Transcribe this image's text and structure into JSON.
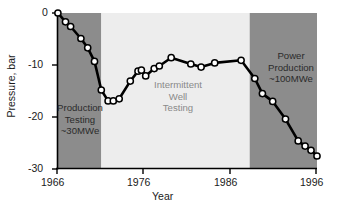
{
  "chart_data": {
    "type": "line",
    "title": "",
    "xlabel": "Year",
    "ylabel": "Pressure, bar",
    "xlim": [
      1966,
      1996
    ],
    "ylim": [
      -30,
      0
    ],
    "xticks": [
      1966,
      1976,
      1986,
      1996
    ],
    "yticks": [
      0,
      -10,
      -20,
      -30
    ],
    "xtick_labels": [
      "1966",
      "1976",
      "1986",
      "1996"
    ],
    "ytick_labels": [
      "0",
      "-10",
      "-20",
      "-30"
    ],
    "grid": false,
    "legend": "none",
    "series": [
      {
        "name": "Reservoir pressure",
        "marker": "circle-open-white",
        "line_color": "#000000",
        "marker_face": "#ffffff",
        "x": [
          1966.1,
          1967.0,
          1967.6,
          1968.8,
          1969.6,
          1970.4,
          1971.1,
          1971.8,
          1972.4,
          1973.0,
          1974.4,
          1975.3,
          1975.8,
          1976.3,
          1977.3,
          1978.6,
          1979.3,
          1981.6,
          1984.6,
          1985.8,
          1987.4,
          1990.4,
          1991.4,
          1992.3,
          1993.3,
          1996.0,
          1996.0,
          1997.0
        ],
        "y": [
          -0.1,
          -1.7,
          -2.6,
          -4.9,
          -6.7,
          -9.3,
          -14.8,
          -16.9,
          -16.9,
          -16.5,
          -13.1,
          -11.2,
          -11.0,
          -12.1,
          -10.7,
          -9.0,
          -9.5,
          -10.0,
          -10.3,
          -9.6,
          -9.1,
          -9.0,
          -15.5,
          -17.0,
          -20.4,
          -24.6,
          -25.6,
          -26.4
        ]
      }
    ],
    "data_points": [
      {
        "x": 1966.1,
        "y": 0.0
      },
      {
        "x": 1967.0,
        "y": -1.7
      },
      {
        "x": 1967.6,
        "y": -2.6
      },
      {
        "x": 1968.8,
        "y": -4.9
      },
      {
        "x": 1969.6,
        "y": -6.7
      },
      {
        "x": 1970.4,
        "y": -9.3
      },
      {
        "x": 1971.2,
        "y": -14.8
      },
      {
        "x": 1972.0,
        "y": -16.9
      },
      {
        "x": 1972.6,
        "y": -16.9
      },
      {
        "x": 1973.3,
        "y": -16.5
      },
      {
        "x": 1974.6,
        "y": -13.1
      },
      {
        "x": 1975.5,
        "y": -11.2
      },
      {
        "x": 1975.9,
        "y": -11.0
      },
      {
        "x": 1976.4,
        "y": -12.1
      },
      {
        "x": 1977.4,
        "y": -10.7
      },
      {
        "x": 1978.0,
        "y": -10.2
      },
      {
        "x": 1979.4,
        "y": -8.6
      },
      {
        "x": 1981.7,
        "y": -9.8
      },
      {
        "x": 1982.9,
        "y": -10.4
      },
      {
        "x": 1984.5,
        "y": -9.6
      },
      {
        "x": 1987.6,
        "y": -9.1
      },
      {
        "x": 1989.2,
        "y": -12.6
      },
      {
        "x": 1990.1,
        "y": -15.5
      },
      {
        "x": 1991.3,
        "y": -17.0
      },
      {
        "x": 1992.8,
        "y": -20.4
      },
      {
        "x": 1994.3,
        "y": -24.6
      },
      {
        "x": 1995.1,
        "y": -25.6
      },
      {
        "x": 1995.8,
        "y": -26.4
      },
      {
        "x": 1996.5,
        "y": -27.5
      }
    ],
    "bands": [
      {
        "name": "Production Testing",
        "x_start": 1966,
        "x_end": 1971.2,
        "color": "#8c8c8c"
      },
      {
        "name": "Intermittent Well Testing",
        "x_start": 1971.2,
        "x_end": 1988.6,
        "color": "#ededed"
      },
      {
        "name": "Power Production",
        "x_start": 1988.6,
        "x_end": 1996.5,
        "color": "#8c8c8c"
      }
    ],
    "annotations": [
      {
        "id": "left",
        "lines": [
          "Production",
          "Testing",
          "~30MWe"
        ]
      },
      {
        "id": "middle",
        "lines": [
          "Intermittent",
          "Well",
          "Testing"
        ]
      },
      {
        "id": "right",
        "lines": [
          "Power",
          "Production",
          "~100MWe"
        ]
      }
    ]
  },
  "axes": {
    "ylabel": "Pressure, bar",
    "xlabel": "Year",
    "xtick_labels": [
      "1966",
      "1976",
      "1986",
      "1996"
    ],
    "ytick_labels": [
      "0",
      "-10",
      "-20",
      "-30"
    ]
  },
  "annotations": {
    "left": {
      "line1": "Production",
      "line2": "Testing",
      "line3": "~30MWe"
    },
    "middle": {
      "line1": "Intermittent",
      "line2": "Well",
      "line3": "Testing"
    },
    "right": {
      "line1": "Power",
      "line2": "Production",
      "line3": "~100MWe"
    }
  },
  "colors": {
    "band_dark": "#8c8c8c",
    "band_light": "#ededed",
    "line": "#000000",
    "marker_fill": "#ffffff",
    "text": "#1a1a1a",
    "mid_text": "#8a8a8a"
  }
}
